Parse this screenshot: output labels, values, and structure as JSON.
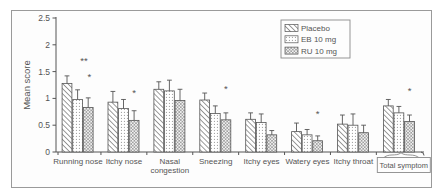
{
  "figure": {
    "background": "#ffffff",
    "frame_border_color": "#9a9a9a",
    "text_color": "#555555",
    "axis_color": "#555555",
    "bar_outline_color": "#555555"
  },
  "chart_data": {
    "type": "bar",
    "title": "",
    "xlabel": "",
    "ylabel": "Mean score",
    "ylim": [
      0,
      2.5
    ],
    "ytick_step": 0.5,
    "ytick_labels": [
      "0",
      "0.5",
      "1",
      "1.5",
      "2",
      "2.5"
    ],
    "grid": false,
    "categories": [
      "Running nose",
      "Itchy nose",
      "Nasal congestion",
      "Sneezing",
      "Itchy eyes",
      "Watery eyes",
      "Itchy throat",
      "Total symptom"
    ],
    "two_line_categories": [
      "Nasal congestion"
    ],
    "boxed_category": "Total symptom",
    "series": [
      {
        "name": "Placebo",
        "pattern": "diagonal-hatch",
        "values": [
          1.28,
          0.93,
          1.17,
          0.97,
          0.61,
          0.38,
          0.52,
          0.86
        ],
        "errors": [
          0.14,
          0.2,
          0.14,
          0.13,
          0.12,
          0.16,
          0.17,
          0.12
        ]
      },
      {
        "name": "EB 10 mg",
        "pattern": "dots",
        "values": [
          0.98,
          0.81,
          1.14,
          0.72,
          0.55,
          0.32,
          0.5,
          0.73
        ],
        "errors": [
          0.18,
          0.17,
          0.2,
          0.14,
          0.16,
          0.1,
          0.21,
          0.12
        ]
      },
      {
        "name": "RU 10 mg",
        "pattern": "crosshatch",
        "values": [
          0.83,
          0.59,
          0.96,
          0.6,
          0.32,
          0.21,
          0.36,
          0.57
        ],
        "errors": [
          0.18,
          0.18,
          0.21,
          0.13,
          0.08,
          0.09,
          0.14,
          0.12
        ]
      }
    ],
    "annotations": [
      {
        "category_index": 0,
        "bar_index": 1.6,
        "label": "**",
        "y": 1.7
      },
      {
        "category_index": 0,
        "bar_index": 2.1,
        "label": "*",
        "y": 1.4
      },
      {
        "category_index": 1,
        "bar_index": 2.0,
        "label": "*",
        "y": 1.1
      },
      {
        "category_index": 3,
        "bar_index": 2.0,
        "label": "*",
        "y": 1.17
      },
      {
        "category_index": 5,
        "bar_index": 2.0,
        "label": "*",
        "y": 0.71
      },
      {
        "category_index": 7,
        "bar_index": 2.0,
        "label": "*",
        "y": 1.14
      }
    ],
    "legend": {
      "position": "top-right-inside",
      "entries": [
        "Placebo",
        "EB 10 mg",
        "RU 10 mg"
      ]
    }
  }
}
